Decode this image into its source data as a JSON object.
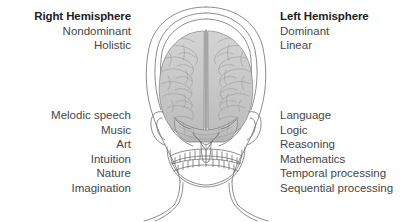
{
  "figure": {
    "background_color": "#ffffff",
    "text_color": "#464646",
    "heading_color": "#1d1d1d"
  },
  "right_hemisphere": {
    "heading": "Right Hemisphere",
    "attributes": [
      "Nondominant",
      "Holistic"
    ],
    "functions": [
      "Melodic speech",
      "Music",
      "Art",
      "Intuition",
      "Nature",
      "Imagination"
    ]
  },
  "left_hemisphere": {
    "heading": "Left Hemisphere",
    "attributes": [
      "Dominant",
      "Linear"
    ],
    "functions": [
      "Language",
      "Logic",
      "Reasoning",
      "Mathematics",
      "Temporal processing",
      "Sequential processing"
    ]
  },
  "illustration": {
    "name": "frontal-head-anatomy-illustration",
    "parts": [
      "head-outline",
      "skull",
      "brain-left-hemisphere",
      "brain-right-hemisphere",
      "longitudinal-fissure",
      "cerebellum",
      "brainstem",
      "upper-teeth",
      "lower-teeth",
      "mandible",
      "ear-left",
      "ear-right",
      "neck",
      "shoulders"
    ],
    "line_color": "#6d6d6d",
    "brain_fill": "#c9c9c9"
  }
}
